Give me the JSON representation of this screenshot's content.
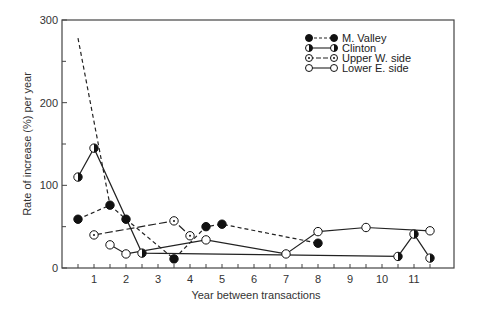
{
  "chart_data": {
    "type": "line",
    "title": "",
    "xlabel": "Year between transactions",
    "ylabel": "Rate of increase (%) per year",
    "xlim": [
      0,
      12.25
    ],
    "ylim": [
      0,
      300
    ],
    "x_ticks": [
      1,
      2,
      3,
      4,
      5,
      6,
      7,
      8,
      9,
      10,
      11
    ],
    "x_minor_ticks": [
      0.5,
      1.5,
      2.5,
      3.5,
      4.5,
      5.5,
      6.5,
      7.5,
      8.5,
      9.5,
      10.5,
      11.5
    ],
    "y_ticks": [
      0,
      100,
      200,
      300
    ],
    "y_minor_ticks": [
      50,
      150,
      250
    ],
    "grid": false,
    "legend_position": "upper right (inside)",
    "series": [
      {
        "name": "M. Valley",
        "line_style": "dashed",
        "marker": "filled-circle",
        "points": [
          [
            0.5,
            59
          ],
          [
            1.5,
            76
          ],
          [
            2,
            59
          ],
          [
            3.5,
            11
          ],
          [
            4.5,
            50
          ],
          [
            5,
            53
          ],
          [
            8,
            30
          ]
        ]
      },
      {
        "name": "Clinton",
        "line_style": "solid",
        "marker": "half-filled-circle",
        "points": [
          [
            0.5,
            110
          ],
          [
            1,
            145
          ],
          [
            2.5,
            18
          ],
          [
            10.5,
            14
          ],
          [
            11,
            41
          ],
          [
            11.5,
            12
          ]
        ]
      },
      {
        "name": "Upper W. side",
        "line_style": "dash-dot",
        "marker": "dotted-circle",
        "points": [
          [
            1,
            40
          ],
          [
            3.5,
            57
          ],
          [
            4,
            39
          ]
        ]
      },
      {
        "name": "Lower E. side",
        "line_style": "solid",
        "marker": "open-circle",
        "points": [
          [
            1.5,
            28
          ],
          [
            2,
            17
          ],
          [
            4.5,
            34
          ],
          [
            7,
            17
          ],
          [
            8,
            44
          ],
          [
            9.5,
            49
          ],
          [
            11.5,
            45
          ]
        ]
      }
    ],
    "annotations": [
      {
        "description": "unmarked dashed line from top (x=0.5, y≈278) descending to M. Valley point (1.5, 76)",
        "line_style": "dashed",
        "points": [
          [
            0.5,
            278
          ],
          [
            1.5,
            76
          ]
        ]
      }
    ]
  }
}
